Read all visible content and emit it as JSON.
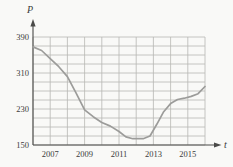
{
  "figure": {
    "y_axis_label": "P",
    "x_axis_label": "t",
    "background_color": "#f9f9f7",
    "grid_color": "#b7b7b4",
    "axis_color": "#4a4a48",
    "curve_color": "#9c9c9a",
    "text_color": "#3c3c3c"
  },
  "chart_data": {
    "type": "line",
    "title": "",
    "xlabel": "t",
    "ylabel": "P",
    "xlim": [
      2006,
      2016
    ],
    "ylim": [
      150,
      390
    ],
    "grid": true,
    "x_gridline_step_years": 1,
    "y_gridline_step_units": 20,
    "x_ticks": [
      {
        "value": 2007,
        "label": "2007"
      },
      {
        "value": 2009,
        "label": "2009"
      },
      {
        "value": 2011,
        "label": "2011"
      },
      {
        "value": 2013,
        "label": "2013"
      },
      {
        "value": 2015,
        "label": "2015"
      }
    ],
    "y_ticks": [
      {
        "value": 390,
        "label": "390"
      },
      {
        "value": 310,
        "label": "310"
      },
      {
        "value": 230,
        "label": "230"
      },
      {
        "value": 150,
        "label": "150"
      }
    ],
    "series": [
      {
        "name": "P",
        "x": [
          2006,
          2007,
          2008,
          2009,
          2010,
          2011,
          2012,
          2013,
          2014,
          2015,
          2016
        ],
        "values": [
          368,
          342,
          302,
          228,
          200,
          180,
          165,
          195,
          242,
          256,
          280
        ]
      }
    ],
    "curve_points": [
      [
        2006.0,
        368
      ],
      [
        2006.5,
        360
      ],
      [
        2007.0,
        342
      ],
      [
        2007.5,
        324
      ],
      [
        2008.0,
        302
      ],
      [
        2008.5,
        266
      ],
      [
        2009.0,
        228
      ],
      [
        2009.5,
        213
      ],
      [
        2010.0,
        200
      ],
      [
        2010.5,
        192
      ],
      [
        2011.0,
        180
      ],
      [
        2011.4,
        168
      ],
      [
        2011.8,
        164
      ],
      [
        2012.4,
        164
      ],
      [
        2012.8,
        170
      ],
      [
        2013.2,
        196
      ],
      [
        2013.6,
        224
      ],
      [
        2014.0,
        242
      ],
      [
        2014.4,
        251
      ],
      [
        2014.8,
        254
      ],
      [
        2015.2,
        258
      ],
      [
        2015.6,
        264
      ],
      [
        2016.0,
        280
      ]
    ]
  }
}
